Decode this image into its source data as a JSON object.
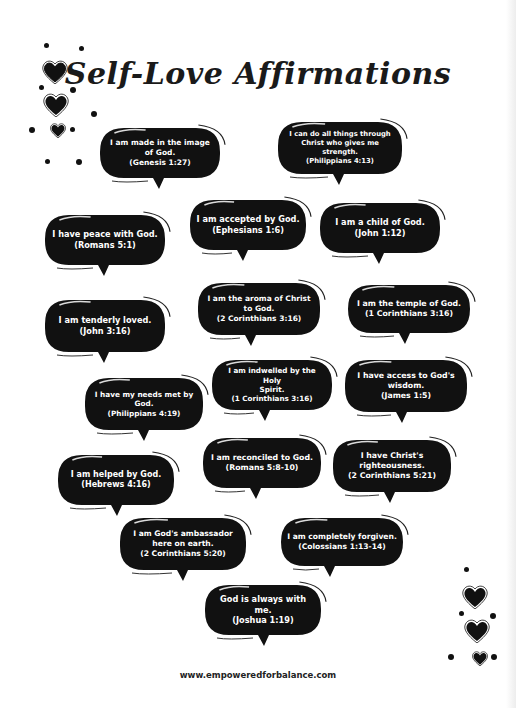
{
  "title": "Self-Love Affirmations",
  "affirmations": [
    {
      "lines": [
        "I am made in the image",
        "of God.",
        "(Genesis 1:27)"
      ]
    },
    {
      "lines": [
        "I can do all things through",
        "Christ who gives me strength.",
        "(Philippians 4:13)"
      ]
    },
    {
      "lines": [
        "I have peace with God.",
        "(Romans 5:1)"
      ]
    },
    {
      "lines": [
        "I am accepted by God.",
        "(Ephesians 1:6)"
      ]
    },
    {
      "lines": [
        "I am a child of God.",
        "(John 1:12)"
      ]
    },
    {
      "lines": [
        "I am tenderly loved.",
        "(John 3:16)"
      ]
    },
    {
      "lines": [
        "I am the aroma of Christ",
        "to God.",
        "(2 Corinthians 3:16)"
      ]
    },
    {
      "lines": [
        "I am the temple of God.",
        "(1 Corinthians 3:16)"
      ]
    },
    {
      "lines": [
        "I have my needs met by",
        "God.",
        "(Philippians 4:19)"
      ]
    },
    {
      "lines": [
        "I am indwelled by the Holy",
        "Spirit.",
        "(1 Corinthians 3:16)"
      ]
    },
    {
      "lines": [
        "I have access to God's",
        "wisdom.",
        "(James 1:5)"
      ]
    },
    {
      "lines": [
        "I am helped by God.",
        "(Hebrews 4:16)"
      ]
    },
    {
      "lines": [
        "I am reconciled to God.",
        "(Romans 5:8-10)"
      ]
    },
    {
      "lines": [
        "I have Christ's",
        "righteousness.",
        "(2 Corinthians 5:21)"
      ]
    },
    {
      "lines": [
        "I am God's ambassador",
        "here on earth.",
        "(2 Corinthians 5:20)"
      ]
    },
    {
      "lines": [
        "I am completely forgiven.",
        "(Colossians 1:13-14)"
      ]
    },
    {
      "lines": [
        "God is always with me.",
        "(Joshua 1:19)"
      ]
    }
  ],
  "decorations": {
    "top_left": "heart-icon-cluster",
    "bottom_right": "heart-icon-cluster"
  },
  "footer": "www.empoweredforbalance.com",
  "colors": {
    "bubble": "#111111",
    "bubble_text": "#ffffff",
    "heading": "#1a1a1a"
  }
}
